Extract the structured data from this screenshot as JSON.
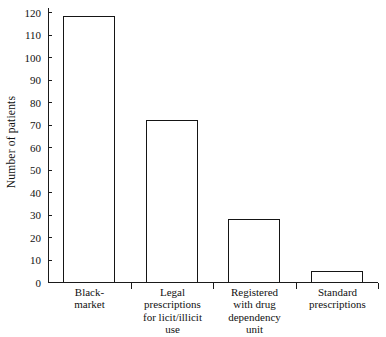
{
  "chart_data": {
    "type": "bar",
    "title": "",
    "xlabel": "",
    "ylabel": "Number of patients",
    "ylim": [
      0,
      120
    ],
    "ytick_interval": 10,
    "yticks": [
      0,
      10,
      20,
      30,
      40,
      50,
      60,
      70,
      80,
      90,
      100,
      110,
      120
    ],
    "grid": false,
    "legend": false,
    "categories": [
      "Black-market",
      "Legal prescriptions for licit/illicit use",
      "Registered with drug dependency unit",
      "Standard prescriptions"
    ],
    "category_lines": [
      [
        "Black-",
        "market"
      ],
      [
        "Legal",
        "prescriptions",
        "for licit/illicit",
        "use"
      ],
      [
        "Registered",
        "with drug",
        "dependency",
        "unit"
      ],
      [
        "Standard",
        "prescriptions"
      ]
    ],
    "values": [
      118,
      72,
      28,
      5
    ],
    "bar_style": {
      "fill": "#ffffff",
      "edge": "#151515"
    }
  },
  "axis": {
    "y_label_text": "Number of patients",
    "tick_labels": [
      "0",
      "10",
      "20",
      "30",
      "40",
      "50",
      "60",
      "70",
      "80",
      "90",
      "100",
      "110",
      "120"
    ]
  },
  "colors": {
    "ink": "#151515",
    "background": "#ffffff"
  }
}
